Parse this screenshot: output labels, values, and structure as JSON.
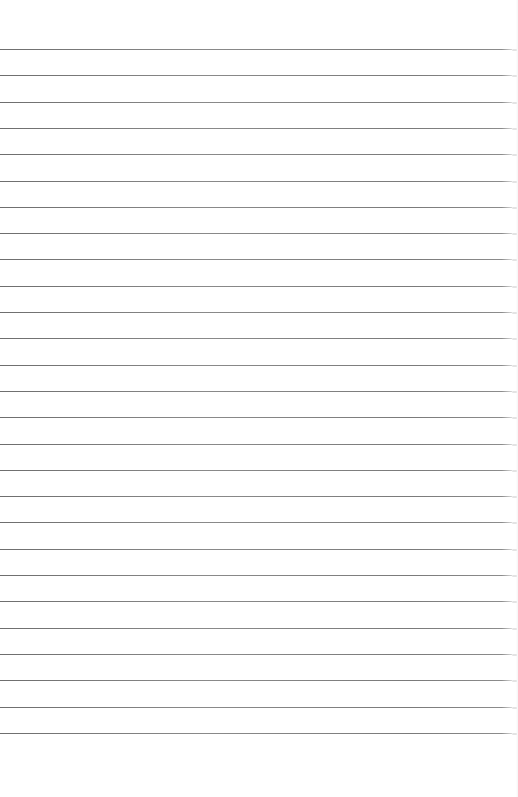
{
  "page": {
    "type": "lined-paper",
    "background_color": "#ffffff",
    "rule_color": "#7a7a7a",
    "rule_count": 27,
    "first_rule_y": 49,
    "rule_spacing": 26.3,
    "rule_width": 512,
    "text": ""
  }
}
